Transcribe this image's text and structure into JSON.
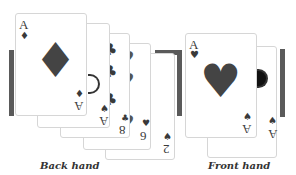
{
  "back_hand": {
    "caption": "Back hand",
    "cards": [
      {
        "rank": "A",
        "suit": "♦",
        "rank_rot": "A",
        "suit_rot": "♦"
      },
      {
        "rank": "A",
        "suit": "♠",
        "rank_rot": "A",
        "suit_rot": "♠"
      },
      {
        "rank": "8",
        "suit": "♣",
        "rank_rot": "8",
        "suit_rot": "♣"
      },
      {
        "rank": "6",
        "suit": "♥",
        "rank_rot": "6",
        "suit_rot": "♥"
      },
      {
        "rank": "2",
        "suit": "♠",
        "rank_rot": "2",
        "suit_rot": "♠"
      }
    ],
    "center_pip": "♦"
  },
  "front_hand": {
    "caption": "Front hand",
    "cards": [
      {
        "rank": "A",
        "suit": "♥",
        "rank_rot": "A",
        "suit_rot": "♠"
      },
      {
        "rank": "A",
        "suit": "♠",
        "rank_rot": "A",
        "suit_rot": "♠"
      }
    ],
    "center_pip": "♥"
  },
  "colors": {
    "ink": "#3a3a3a",
    "bar": "#5a5a5a",
    "card_border": "#d6d6d6"
  }
}
